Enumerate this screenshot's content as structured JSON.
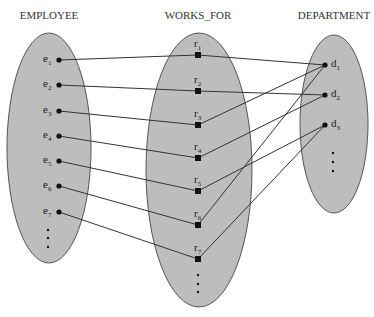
{
  "titles": {
    "employee": "EMPLOYEE",
    "works_for": "WORKS_FOR",
    "department": "DEPARTMENT"
  },
  "colors": {
    "ellipse_fill": "#bdbdbd",
    "ellipse_stroke": "#555555",
    "line": "#333333",
    "point": "#111111"
  },
  "employee_set": {
    "ellipse": {
      "cx": 49,
      "cy": 148,
      "rx": 42,
      "ry": 115
    },
    "elements": [
      {
        "label": "e",
        "sub": "1",
        "x": 59,
        "y": 60
      },
      {
        "label": "e",
        "sub": "2",
        "x": 59,
        "y": 85
      },
      {
        "label": "e",
        "sub": "3",
        "x": 59,
        "y": 111
      },
      {
        "label": "e",
        "sub": "4",
        "x": 59,
        "y": 136
      },
      {
        "label": "e",
        "sub": "5",
        "x": 59,
        "y": 161
      },
      {
        "label": "e",
        "sub": "6",
        "x": 59,
        "y": 186
      },
      {
        "label": "e",
        "sub": "7",
        "x": 59,
        "y": 212
      }
    ],
    "ellipsis_dots": [
      {
        "x": 48,
        "y": 230
      },
      {
        "x": 48,
        "y": 238
      },
      {
        "x": 48,
        "y": 247
      }
    ]
  },
  "works_for_set": {
    "ellipse": {
      "cx": 199,
      "cy": 170,
      "rx": 53,
      "ry": 137
    },
    "elements": [
      {
        "label": "r",
        "sub": "1",
        "x": 198,
        "y": 55
      },
      {
        "label": "r",
        "sub": "2",
        "x": 198,
        "y": 91
      },
      {
        "label": "r",
        "sub": "3",
        "x": 198,
        "y": 125
      },
      {
        "label": "r",
        "sub": "4",
        "x": 198,
        "y": 158
      },
      {
        "label": "r",
        "sub": "5",
        "x": 198,
        "y": 191
      },
      {
        "label": "r",
        "sub": "6",
        "x": 198,
        "y": 225
      },
      {
        "label": "r",
        "sub": "7",
        "x": 198,
        "y": 259
      }
    ],
    "ellipsis_dots": [
      {
        "x": 198,
        "y": 275
      },
      {
        "x": 198,
        "y": 284
      },
      {
        "x": 198,
        "y": 292
      }
    ]
  },
  "department_set": {
    "ellipse": {
      "cx": 334,
      "cy": 124,
      "rx": 34,
      "ry": 89
    },
    "elements": [
      {
        "label": "d",
        "sub": "1",
        "x": 325,
        "y": 65
      },
      {
        "label": "d",
        "sub": "2",
        "x": 325,
        "y": 95
      },
      {
        "label": "d",
        "sub": "3",
        "x": 325,
        "y": 125
      }
    ],
    "ellipsis_dots": [
      {
        "x": 333,
        "y": 153
      },
      {
        "x": 333,
        "y": 162
      },
      {
        "x": 333,
        "y": 171
      }
    ]
  },
  "links_employee_to_relation": [
    [
      0,
      0
    ],
    [
      1,
      1
    ],
    [
      2,
      2
    ],
    [
      3,
      3
    ],
    [
      4,
      4
    ],
    [
      5,
      5
    ],
    [
      6,
      6
    ]
  ],
  "links_relation_to_department": [
    [
      0,
      0
    ],
    [
      1,
      1
    ],
    [
      2,
      0
    ],
    [
      3,
      1
    ],
    [
      4,
      2
    ],
    [
      5,
      0
    ],
    [
      6,
      2
    ]
  ]
}
